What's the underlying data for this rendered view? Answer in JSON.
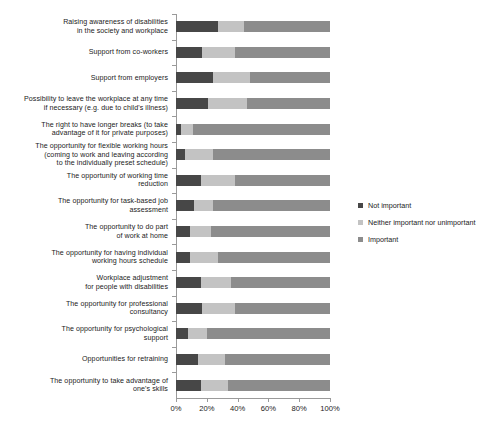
{
  "chart_data": {
    "type": "bar",
    "orientation": "horizontal",
    "stacked": true,
    "normalized_percent": true,
    "title": "",
    "subtitle": "",
    "xlabel": "",
    "ylabel": "",
    "xlim": [
      0,
      100
    ],
    "xticks": [
      "0%",
      "20%",
      "40%",
      "60%",
      "80%",
      "100%"
    ],
    "xtick_values": [
      0,
      20,
      40,
      60,
      80,
      100
    ],
    "grid": false,
    "legend_position": "right",
    "categories": [
      "Raising awareness of disabilities\nin the society and workplace",
      "Support from co-workers",
      "Support from employers",
      "Possibility to leave the workplace at any time\nif necessary (e.g. due to child's illness)",
      "The right to have longer breaks (to take\nadvantage of it for private purposes)",
      "The opportunity for flexible working hours\n(coming to work and leaving according\nto the individually preset schedule)",
      "The opportunity of working time\nreduction",
      "The opportunity for task-based job\nassessment",
      "The opportunity to do part\nof work at home",
      "The opportunity for having individual\nworking hours schedule",
      "Workplace adjustment\nfor people with disabilities",
      "The opportunity for professional\nconsultancy",
      "The opportunity for psychological\nsupport",
      "Opportunities for retraining",
      "The opportunity to take advantage of\none's skills"
    ],
    "series": [
      {
        "name": "Not important",
        "color": "#474747",
        "values": [
          27,
          17,
          24,
          21,
          3,
          6,
          16,
          12,
          9,
          9,
          16,
          17,
          8,
          14,
          16
        ]
      },
      {
        "name": "Neither important nor unimportant",
        "color": "#c3c3c3",
        "values": [
          17,
          21,
          24,
          25,
          8,
          18,
          22,
          12,
          14,
          18,
          20,
          21,
          12,
          18,
          18
        ]
      },
      {
        "name": "Important",
        "color": "#8c8c8c",
        "values": [
          56,
          62,
          52,
          54,
          89,
          76,
          62,
          76,
          77,
          73,
          64,
          62,
          80,
          68,
          66
        ]
      }
    ]
  },
  "legend": {
    "items": [
      {
        "label": "Not important",
        "color": "#474747"
      },
      {
        "label": "Neither important nor unimportant",
        "color": "#c3c3c3"
      },
      {
        "label": "Important",
        "color": "#8c8c8c"
      }
    ]
  }
}
